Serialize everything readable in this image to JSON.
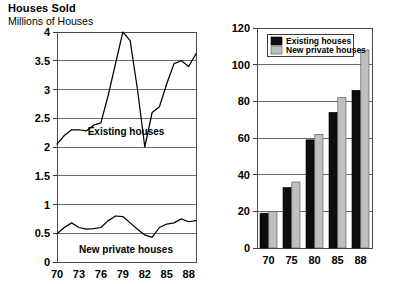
{
  "header": {
    "title": "Houses Sold",
    "subtitle": "Millions of Houses"
  },
  "colors": {
    "existing": "#0d0d0d",
    "new_private": "#bfbfbf",
    "gridline": "#6b6b6b",
    "frame": "#4a4a4a",
    "background": "#ffffff"
  },
  "left_chart": {
    "ylabel": "Millions of Houses",
    "yticks": [
      "0",
      "0.5",
      "1",
      "1.5",
      "2",
      "2.5",
      "3",
      "3.5",
      "4"
    ],
    "xticks": [
      "70",
      "73",
      "76",
      "79",
      "82",
      "85",
      "88"
    ],
    "series_label_existing": "Existing houses",
    "series_label_new": "New private houses"
  },
  "right_chart": {
    "yticks": [
      "0",
      "20",
      "40",
      "60",
      "80",
      "100",
      "120"
    ],
    "xticks": [
      "70",
      "75",
      "80",
      "85",
      "88"
    ],
    "legend": [
      {
        "label": "Existing houses",
        "swatch": "existing"
      },
      {
        "label": "New private houses",
        "swatch": "new_private"
      }
    ]
  },
  "chart_data": [
    {
      "type": "line",
      "title": "Houses Sold",
      "subtitle": "Millions of Houses",
      "xlabel": "",
      "ylabel": "Millions of Houses",
      "xlim": [
        1970,
        1989
      ],
      "ylim": [
        0,
        4
      ],
      "yticks": [
        0,
        0.5,
        1,
        1.5,
        2,
        2.5,
        3,
        3.5,
        4
      ],
      "xticks": [
        70,
        73,
        76,
        79,
        82,
        85,
        88
      ],
      "grid": true,
      "legend_position": "inline-annotation",
      "x": [
        1970,
        1971,
        1972,
        1973,
        1974,
        1975,
        1976,
        1977,
        1978,
        1979,
        1980,
        1981,
        1982,
        1983,
        1984,
        1985,
        1986,
        1987,
        1988,
        1989
      ],
      "series": [
        {
          "name": "Existing houses",
          "values": [
            2.05,
            2.2,
            2.3,
            2.3,
            2.28,
            2.38,
            2.42,
            2.9,
            3.45,
            4.0,
            3.85,
            3.0,
            2.0,
            2.6,
            2.7,
            3.1,
            3.45,
            3.5,
            3.4,
            3.62
          ]
        },
        {
          "name": "New private houses",
          "values": [
            0.49,
            0.6,
            0.68,
            0.6,
            0.57,
            0.58,
            0.6,
            0.72,
            0.8,
            0.79,
            0.68,
            0.57,
            0.47,
            0.43,
            0.6,
            0.66,
            0.68,
            0.75,
            0.7,
            0.72
          ]
        }
      ]
    },
    {
      "type": "bar",
      "title": "",
      "xlabel": "",
      "ylabel": "",
      "ylim": [
        0,
        120
      ],
      "yticks": [
        0,
        20,
        40,
        60,
        80,
        100,
        120
      ],
      "categories": [
        "70",
        "75",
        "80",
        "85",
        "88"
      ],
      "grid": true,
      "legend_position": "top-left",
      "series": [
        {
          "name": "Existing houses",
          "values": [
            19,
            33,
            59,
            74,
            86
          ]
        },
        {
          "name": "New private houses",
          "values": [
            20,
            36,
            62,
            82,
            108
          ]
        }
      ]
    }
  ]
}
